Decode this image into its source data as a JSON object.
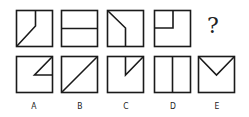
{
  "question_row": {
    "figures": [
      {
        "id": "q1",
        "description": "square with vertical line from top at 2/3 width going down then diagonal to bottom-left corner"
      },
      {
        "id": "q2",
        "description": "square with horizontal line across middle"
      },
      {
        "id": "q3",
        "description": "square with diagonal from top-left going down-right then vertical to bottom"
      },
      {
        "id": "q4",
        "description": "square with L-shaped line in top-left quadrant: vertical from top then horizontal to left edge"
      }
    ],
    "placeholder": "?"
  },
  "options": [
    {
      "label": "A",
      "description": "small triangle in top-right: diagonal from top-right corner to center, horizontal to right edge"
    },
    {
      "label": "B",
      "description": "diagonal from bottom-left to top-right corner"
    },
    {
      "label": "C",
      "description": "vertical line from top at center to middle, then diagonal to top-right corner"
    },
    {
      "label": "D",
      "description": "vertical line dividing square in half"
    },
    {
      "label": "E",
      "description": "V shape from top-left corner to center to top-right corner"
    }
  ],
  "colors": {
    "stroke": "#1a1a1a",
    "background": "#ffffff"
  }
}
